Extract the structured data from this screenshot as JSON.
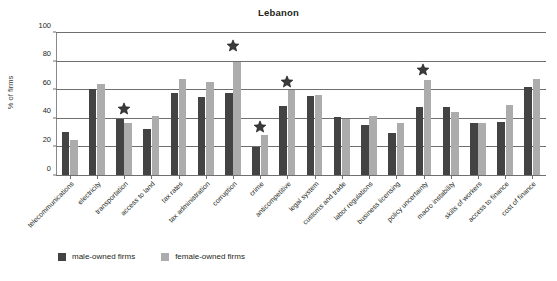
{
  "chart_data": {
    "type": "bar",
    "title": "Lebanon",
    "xlabel": "",
    "ylabel": "% of firms",
    "ylim": [
      0,
      100
    ],
    "yticks": [
      0,
      20,
      40,
      60,
      80,
      100
    ],
    "grid": true,
    "legend_position": "bottom-left",
    "categories": [
      "telecommunications",
      "electricity",
      "transportation",
      "access to land",
      "tax rates",
      "tax administration",
      "corruption",
      "crime",
      "anticompetitive",
      "legal system",
      "customs and trade",
      "labor regulations",
      "business licensing",
      "policy uncertainty",
      "macro instability",
      "skills of workers",
      "access to finance",
      "cost of finance"
    ],
    "series": [
      {
        "name": "male-owned firms",
        "color": "#434343",
        "values": [
          31,
          61,
          40,
          33,
          58,
          55,
          58,
          20,
          49,
          56,
          41,
          36,
          30,
          48,
          48,
          37,
          38,
          62
        ]
      },
      {
        "name": "female-owned firms",
        "color": "#acacac",
        "values": [
          25,
          64,
          37,
          42,
          68,
          66,
          80,
          29,
          60,
          57,
          40,
          42,
          37,
          67,
          45,
          37,
          50,
          68
        ]
      }
    ],
    "annotations": {
      "marker": "star",
      "meaning": "statistically significant difference",
      "marked_categories": [
        "transportation",
        "corruption",
        "crime",
        "anticompetitive",
        "policy uncertainty"
      ],
      "marker_values": [
        47,
        91,
        34,
        66,
        74
      ]
    }
  },
  "legend": {
    "items": [
      {
        "label": "male-owned firms",
        "color": "#434343",
        "swatch_name": "legend-swatch-male"
      },
      {
        "label": "female-owned firms",
        "color": "#acacac",
        "swatch_name": "legend-swatch-female"
      }
    ]
  }
}
